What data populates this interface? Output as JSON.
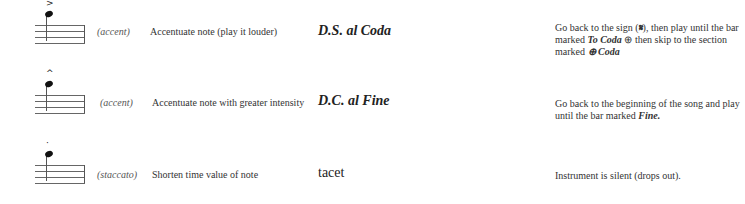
{
  "rows": [
    {
      "symbol_icon": "accent-note-icon",
      "mark": ">",
      "name": "(accent)",
      "description": "Accentuate note (play it louder)",
      "term": "D.S. al Coda",
      "explanation_parts": [
        "Go back to the sign (",
        "𝄋",
        "), then play until the bar marked ",
        "To Coda",
        " ⊕ then skip to the section marked ",
        "⊕ Coda"
      ]
    },
    {
      "symbol_icon": "marcato-note-icon",
      "mark": "^",
      "name": "(accent)",
      "description": "Accentuate note with greater intensity",
      "term": "D.C. al Fine",
      "explanation_parts": [
        "Go back to the beginning of the song and play until the bar marked ",
        "Fine."
      ]
    },
    {
      "symbol_icon": "staccato-note-icon",
      "mark": "·",
      "name": "(staccato)",
      "description": "Shorten time value of note",
      "term": "tacet",
      "explanation": "Instrument is silent (drops out)."
    }
  ]
}
